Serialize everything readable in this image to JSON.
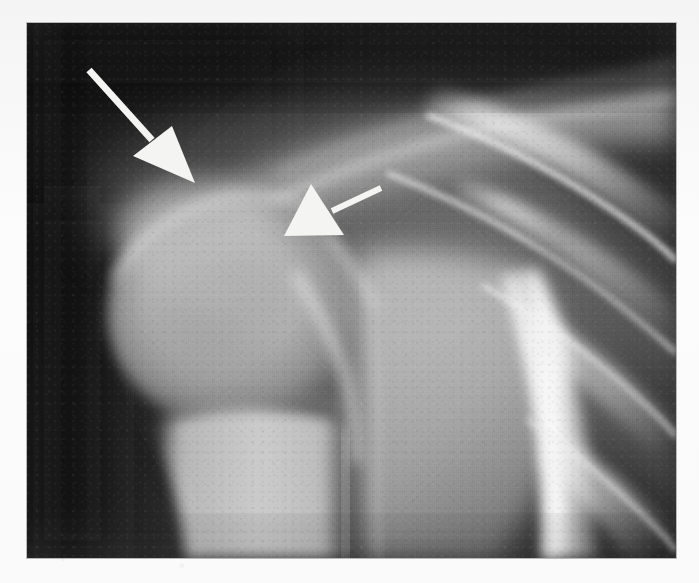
{
  "image": {
    "modality": "radiograph",
    "view": "AP shoulder",
    "frame": {
      "x": 27,
      "y": 23,
      "width": 649,
      "height": 535
    },
    "canvas": {
      "width": 699,
      "height": 583
    },
    "page_background": "#fbfbfb",
    "border_color": "#b9b9b9"
  },
  "tones": {
    "darkest_soft_tissue": "#1a1a1a",
    "dark_background": "#232323",
    "mid_soft_tissue": "#8d8d8d",
    "bone_cancellous": "#c4c4c4",
    "bone_cortex": "#ededed",
    "brightest": "#f7f7f7",
    "annotation_white": "#f4f4f2"
  },
  "anatomy": [
    {
      "name": "humeral-head",
      "label": "Humeral head",
      "cx": 205,
      "cy": 280,
      "rx": 120,
      "ry": 110
    },
    {
      "name": "greater-tuberosity",
      "label": "Greater tuberosity",
      "cx": 165,
      "cy": 205,
      "rx": 70,
      "ry": 48
    },
    {
      "name": "surgical-neck",
      "label": "Surgical neck",
      "cx": 235,
      "cy": 370,
      "rx": 105,
      "ry": 45
    },
    {
      "name": "humeral-shaft",
      "label": "Proximal humeral shaft",
      "cx": 225,
      "cy": 470,
      "rx": 95,
      "ry": 95
    },
    {
      "name": "glenoid-joint-space",
      "label": "Glenohumeral joint space",
      "cx": 330,
      "cy": 300,
      "rx": 30,
      "ry": 95
    },
    {
      "name": "scapula-glenoid",
      "label": "Glenoid / scapula",
      "cx": 400,
      "cy": 330,
      "rx": 90,
      "ry": 140
    },
    {
      "name": "clavicle",
      "label": "Clavicle",
      "cx": 430,
      "cy": 150,
      "rx": 200,
      "ry": 34
    },
    {
      "name": "acromion",
      "label": "Acromion",
      "cx": 300,
      "cy": 160,
      "rx": 110,
      "ry": 40
    },
    {
      "name": "lateral-chest-wall",
      "label": "Lateral chest wall",
      "cx": 520,
      "cy": 430,
      "rx": 60,
      "ry": 150
    },
    {
      "name": "rib-cage",
      "label": "Ribs",
      "cx": 580,
      "cy": 330,
      "rx": 110,
      "ry": 220
    }
  ],
  "annotations": {
    "arrows": [
      {
        "name": "arrow-greater-tuberosity",
        "label": "Arrow 1 - large arrow, points down-right at greater tuberosity lesion",
        "color": "#f4f4f2",
        "direction": "down-right",
        "tail_start": {
          "x": 89,
          "y": 70
        },
        "tail_end": {
          "x": 152,
          "y": 140
        },
        "tail_width": 7,
        "head": [
          {
            "x": 133,
            "y": 156
          },
          {
            "x": 172,
            "y": 126
          },
          {
            "x": 195,
            "y": 183
          }
        ]
      },
      {
        "name": "arrow-humeral-neck",
        "label": "Arrow 2 - small arrow, points down-left at humeral head cortex",
        "color": "#f4f4f2",
        "direction": "down-left",
        "tail_start": {
          "x": 381,
          "y": 188
        },
        "tail_end": {
          "x": 332,
          "y": 211
        },
        "tail_width": 6,
        "head": [
          {
            "x": 284,
            "y": 236
          },
          {
            "x": 311,
            "y": 184
          },
          {
            "x": 344,
            "y": 235
          }
        ]
      }
    ]
  }
}
